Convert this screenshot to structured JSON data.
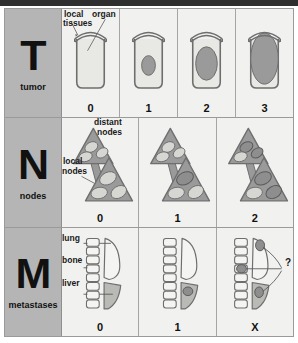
{
  "figure": {
    "colors": {
      "frame_border": "#9a9a9a",
      "label_cell_bg": "#b5b5b5",
      "panel_bg": "#f1f1ef",
      "outline": "#6e6e6e",
      "tumor_fill": "#9a9a9a",
      "node_pale_fill": "#d6d6d2",
      "node_involved_fill": "#8e8e8e",
      "organ_fill": "#e8e8e4",
      "liver_fill": "#b9b9b5",
      "text": "#111111"
    }
  },
  "rows": [
    {
      "letter": "T",
      "word": "tumor",
      "label_name": "tumor",
      "callouts": [
        {
          "text": "local",
          "name": "local-label"
        },
        {
          "text": "tissues",
          "name": "tissues-label"
        },
        {
          "text": "organ",
          "name": "organ-label"
        }
      ],
      "stages": [
        {
          "num": "0",
          "caption": "no tumor in organ"
        },
        {
          "num": "1",
          "caption": "small tumor confined to organ"
        },
        {
          "num": "2",
          "caption": "larger tumor confined to organ"
        },
        {
          "num": "3",
          "caption": "tumor extends beyond organ into local tissues"
        }
      ]
    },
    {
      "letter": "N",
      "word": "nodes",
      "label_name": "nodes",
      "callouts": [
        {
          "text": "distant",
          "name": "distant-label"
        },
        {
          "text": "nodes",
          "name": "distant-nodes-label"
        },
        {
          "text": "local",
          "name": "local-label"
        },
        {
          "text": "nodes",
          "name": "local-nodes-label"
        }
      ],
      "stages": [
        {
          "num": "0",
          "caption": "no nodes involved"
        },
        {
          "num": "1",
          "caption": "local nodes involved"
        },
        {
          "num": "2",
          "caption": "local and distant nodes involved"
        }
      ]
    },
    {
      "letter": "M",
      "word": "metastases",
      "label_name": "metastases",
      "callouts": [
        {
          "text": "lung",
          "name": "lung-label"
        },
        {
          "text": "bone",
          "name": "bone-label"
        },
        {
          "text": "liver",
          "name": "liver-label"
        }
      ],
      "stages": [
        {
          "num": "0",
          "caption": "no distant metastases"
        },
        {
          "num": "1",
          "caption": "metastasis present in liver"
        },
        {
          "num": "X",
          "caption": "metastases cannot be assessed",
          "query_mark": "?"
        }
      ]
    }
  ]
}
